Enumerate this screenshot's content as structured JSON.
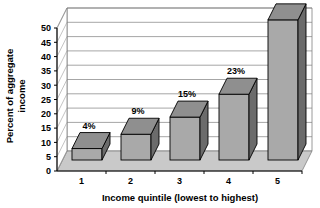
{
  "chart_data": {
    "type": "bar",
    "title": "",
    "subtitle": "",
    "xlabel": "Income quintile (lowest to highest)",
    "ylabel": "Percent of aggregate income",
    "ylabel_line1": "Percent of aggregate",
    "ylabel_line2": "income",
    "categories": [
      "1",
      "2",
      "3",
      "4",
      "5"
    ],
    "values": [
      4,
      9,
      15,
      23,
      49
    ],
    "data_labels": [
      "4%",
      "9%",
      "15%",
      "23%",
      "49%"
    ],
    "ylim": [
      0,
      50
    ],
    "ytick_values": [
      0,
      5,
      10,
      15,
      20,
      25,
      30,
      35,
      40,
      45,
      50
    ],
    "yticks": [
      "0",
      "5",
      "10",
      "15",
      "20",
      "25",
      "30",
      "35",
      "40",
      "45",
      "50"
    ],
    "grid": true,
    "grid_axis": "y",
    "legend": false,
    "legend_position": "none",
    "style": "3d-column",
    "colors": {
      "bar_front": "#a9a9a9",
      "bar_side": "#6b6b6b",
      "bar_top": "#8f8f8f",
      "plot_background": "#ffffff",
      "floor": "#c9c9c9",
      "gridline": "#808080",
      "axis": "#000000",
      "text": "#000000"
    }
  }
}
